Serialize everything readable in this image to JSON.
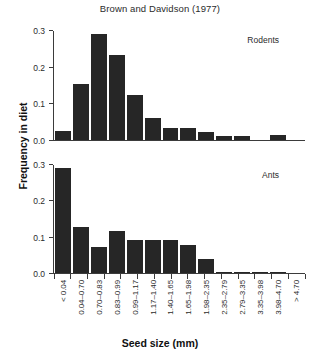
{
  "chart_data": {
    "type": "bar",
    "title": "Brown and Davidson (1977)",
    "xlabel": "Seed size (mm)",
    "ylabel": "Frequency in diet",
    "grid": false,
    "legend_position": "inside-panel-top-right",
    "ylim": [
      0.0,
      0.3
    ],
    "yticks": [
      "0.0",
      "0.1",
      "0.2",
      "0.3"
    ],
    "ytick_values": [
      0.0,
      0.1,
      0.2,
      0.3
    ],
    "categories": [
      "< 0.04",
      "0.04–0.70",
      "0.70–0.83",
      "0.83–0.99",
      "0.99–1.17",
      "1.17–1.40",
      "1.40–1.65",
      "1.65–1.98",
      "1.98–2.35",
      "2.35–2.79",
      "2.79–3.35",
      "3.35–3.98",
      "3.98–4.70",
      "> 4.70"
    ],
    "panels": [
      {
        "name": "Rodents",
        "values": [
          0.025,
          0.153,
          0.291,
          0.233,
          0.125,
          0.06,
          0.033,
          0.033,
          0.021,
          0.01,
          0.01,
          0.0,
          0.013
        ]
      },
      {
        "name": "Ants",
        "values": [
          0.293,
          0.128,
          0.071,
          0.118,
          0.092,
          0.092,
          0.092,
          0.079,
          0.04,
          0.004,
          0.004,
          0.004,
          0.004
        ]
      }
    ],
    "bar_color": "#262626",
    "axis_color": "#3b3b3b"
  }
}
